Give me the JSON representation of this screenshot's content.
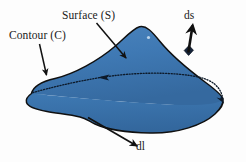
{
  "figure": {
    "background_color": "#fdfdfd",
    "surface_fill_color": "#3a74af",
    "surface_fill_color_light": "#4a83bb",
    "outline_color": "#101010",
    "label_color": "#1a1a1a",
    "labels": {
      "contour": "Contour (C)",
      "surface": "Surface (S)",
      "ds": "ds",
      "dl": "dl"
    },
    "annotations": [
      {
        "name": "contour-leader",
        "label": "Contour (C)",
        "from": [
          40,
          44
        ],
        "to": [
          47,
          78
        ]
      },
      {
        "name": "surface-leader",
        "label": "Surface (S)",
        "from": [
          97,
          23
        ],
        "to": [
          128,
          60
        ]
      },
      {
        "name": "ds-leader",
        "label": "ds",
        "from": [
          188,
          52
        ],
        "to": [
          193,
          23
        ]
      },
      {
        "name": "dl-leader",
        "label": "dl",
        "from": [
          88,
          118
        ],
        "to": [
          139,
          147
        ]
      }
    ],
    "elements": {
      "surface_patch": "blue shaded irregular blob",
      "contour_line": "dotted curve crossing the blob with direction arrowheads",
      "ds_patch": "small dark parallelogram on the surface",
      "highlight_dot": "small white specular dot"
    }
  }
}
